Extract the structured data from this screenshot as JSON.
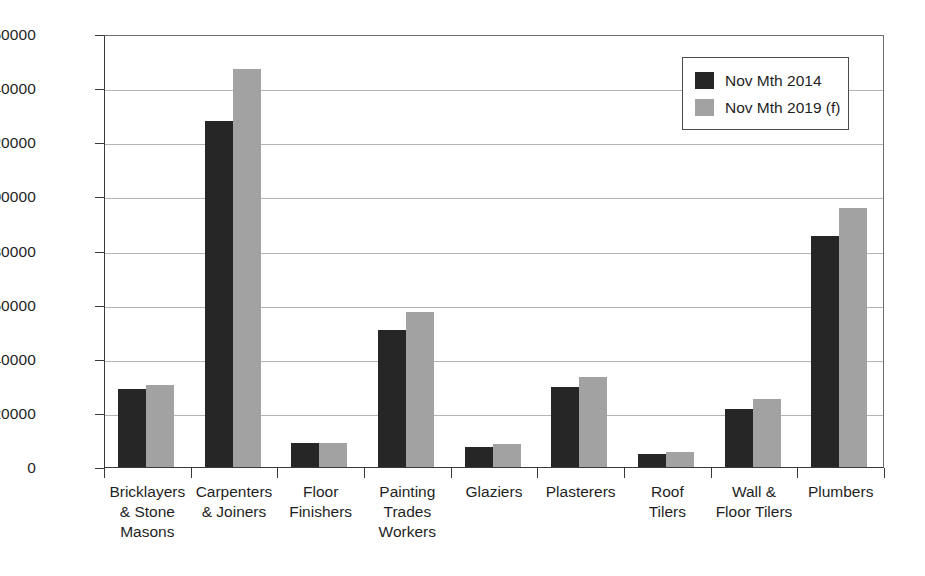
{
  "chart_data": {
    "type": "bar",
    "title": "",
    "subtitle": "",
    "xlabel": "",
    "ylabel": "",
    "ylim": [
      0,
      160000
    ],
    "ytick_step": 20000,
    "yticks": [
      0,
      20000,
      40000,
      60000,
      80000,
      100000,
      120000,
      140000,
      160000
    ],
    "ytick_labels": [
      "0",
      "20000",
      "40000",
      "60000",
      "80000",
      "100000",
      "120000",
      "140000",
      "160000"
    ],
    "grid": true,
    "grid_axis": "y",
    "legend_position": "top-right",
    "categories": [
      "Bricklayers\n& Stone\nMasons",
      "Carpenters\n& Joiners",
      "Floor\nFinishers",
      "Painting\nTrades\nWorkers",
      "Glaziers",
      "Plasterers",
      "Roof\nTilers",
      "Wall &\nFloor Tilers",
      "Plumbers"
    ],
    "series": [
      {
        "name": "Nov Mth 2014",
        "color": "#262626",
        "values": [
          28900,
          128000,
          8900,
          50800,
          7500,
          29500,
          4800,
          21500,
          85400
        ]
      },
      {
        "name": "Nov Mth 2019 (f)",
        "color": "#a2a2a2",
        "values": [
          30400,
          147000,
          8900,
          57100,
          8600,
          33200,
          5500,
          25000,
          95700
        ]
      }
    ]
  },
  "legend": {
    "items": [
      {
        "label": "Nov Mth 2014",
        "color": "#262626"
      },
      {
        "label": "Nov Mth 2019 (f)",
        "color": "#a2a2a2"
      }
    ]
  },
  "colors": {
    "series_2014": "#262626",
    "series_2019": "#a2a2a2",
    "axis": "#3a3a3a",
    "grid": "#b4b4b4",
    "background": "#ffffff"
  }
}
